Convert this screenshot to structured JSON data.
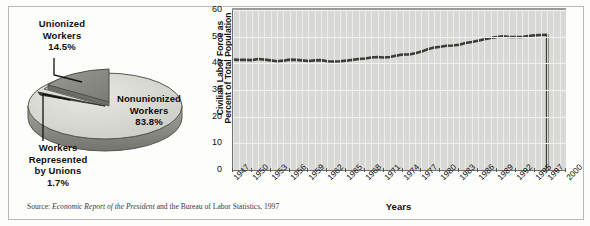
{
  "figure": {
    "source_prefix": "Source: ",
    "source_italic": "Economic Report of the President",
    "source_suffix": " and the Bureau of Labor Statistics, 1997"
  },
  "pie": {
    "labels": {
      "unionized": "Unionized\nWorkers\n14.5%",
      "unionized_l1": "Unionized",
      "unionized_l2": "Workers",
      "unionized_l3": "14.5%",
      "represented_l1": "Workers",
      "represented_l2": "Represented",
      "represented_l3": "by Unions",
      "represented_l4": "1.7%",
      "nonunion_l1": "Nonunionized",
      "nonunion_l2": "Workers",
      "nonunion_l3": "83.8%"
    },
    "colors": {
      "top_face": "#d9d9d4",
      "side_face": "#8d8d87",
      "wedge": "#8a8a84",
      "outline": "#55554f"
    }
  },
  "chart_data": {
    "type": "line",
    "title": "",
    "xlabel": "Years",
    "ylabel": "Civilian Labor Force as Percent of Total Population",
    "ylabel_line1": "Civilian Labor Force as",
    "ylabel_line2": "Percent of Total Population",
    "ylim": [
      0,
      60
    ],
    "yticks": [
      0,
      10,
      20,
      30,
      40,
      50,
      60
    ],
    "grid": true,
    "legend": "none",
    "xlim": [
      1947,
      2000
    ],
    "tick_labels": [
      "1947",
      "1950",
      "1953",
      "1956",
      "1959",
      "1962",
      "1965",
      "1968",
      "1971",
      "1974",
      "1977",
      "1980",
      "1983",
      "1986",
      "1989",
      "1992",
      "1995",
      "1997",
      "2000"
    ],
    "x": [
      1947,
      1948,
      1949,
      1950,
      1951,
      1952,
      1953,
      1954,
      1955,
      1956,
      1957,
      1958,
      1959,
      1960,
      1961,
      1962,
      1963,
      1964,
      1965,
      1966,
      1967,
      1968,
      1969,
      1970,
      1971,
      1972,
      1973,
      1974,
      1975,
      1976,
      1977,
      1978,
      1979,
      1980,
      1981,
      1982,
      1983,
      1984,
      1985,
      1986,
      1987,
      1988,
      1989,
      1990,
      1991,
      1992,
      1993,
      1994,
      1995,
      1996,
      1997
    ],
    "values": [
      41.4,
      41.3,
      41.3,
      41.2,
      41.6,
      41.4,
      41.1,
      40.8,
      41.0,
      41.4,
      41.3,
      41.1,
      40.9,
      41.1,
      41.2,
      40.8,
      40.7,
      40.8,
      41.0,
      41.3,
      41.6,
      41.8,
      42.2,
      42.4,
      42.2,
      42.4,
      42.9,
      43.3,
      43.3,
      43.8,
      44.4,
      45.3,
      45.9,
      46.2,
      46.6,
      46.7,
      47.0,
      47.6,
      48.0,
      48.5,
      49.0,
      49.5,
      49.9,
      50.1,
      49.9,
      49.9,
      49.9,
      50.2,
      50.5,
      50.6,
      50.7
    ],
    "final_drop_year": 1997,
    "line_color": "#3c3c38",
    "plot_bg": "#d8d8d4"
  }
}
